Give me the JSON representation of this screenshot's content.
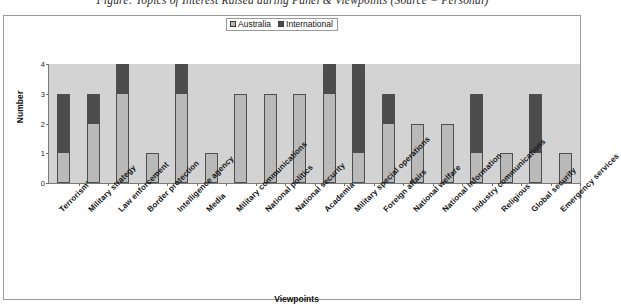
{
  "figure": {
    "caption": "Figure: Topics of Interest Raised during Panel & Viewpoints (Source = Personal)"
  },
  "chart_data": {
    "type": "bar",
    "title": "",
    "subtitle": "",
    "xlabel": "Viewpoints",
    "ylabel": "Number",
    "ylim": [
      0,
      4
    ],
    "yticks": [
      0,
      1,
      2,
      3,
      4
    ],
    "grid": false,
    "stacked": true,
    "legend_position": "top-center",
    "categories": [
      "Terrorism'",
      "Military strategy",
      "Law enforcement",
      "Border protection",
      "Intelligence agency",
      "Media",
      "Military communications",
      "National politics",
      "National security",
      "Academia",
      "Military special operations",
      "Foreign affairs",
      "National welfare",
      "National information",
      "Industry communications",
      "Religious",
      "Global security",
      "Emergency services"
    ],
    "series": [
      {
        "name": "Australia",
        "color": "#b9b9b9",
        "values": [
          1,
          2,
          3,
          1,
          3,
          1,
          3,
          3,
          3,
          3,
          1,
          2,
          2,
          2,
          1,
          1,
          1,
          1
        ]
      },
      {
        "name": "International",
        "color": "#4c4c4c",
        "values": [
          2,
          1,
          1,
          0,
          1,
          0,
          0,
          0,
          0,
          1,
          3,
          1,
          0,
          0,
          2,
          0,
          2,
          0
        ]
      }
    ],
    "totals": [
      3,
      3,
      4,
      1,
      4,
      1,
      3,
      3,
      3,
      4,
      4,
      3,
      2,
      2,
      3,
      1,
      3,
      1
    ]
  },
  "legend": {
    "items": [
      {
        "label": "Australia",
        "swatch": "legend-swatch-australia"
      },
      {
        "label": "International",
        "swatch": "legend-swatch-international"
      }
    ]
  },
  "colors": {
    "australia": "#b9b9b9",
    "international": "#4c4c4c",
    "plot_background": "#d3d3d3",
    "frame_border": "#9a9a9a",
    "bar_outline": "#4f4f4f",
    "page_background": "#ffffff"
  }
}
